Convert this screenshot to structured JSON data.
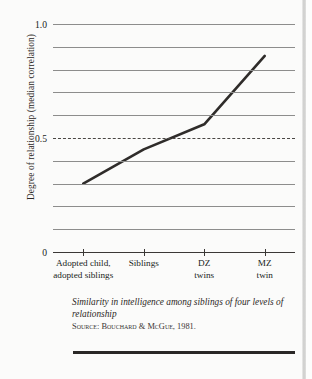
{
  "chart_data": {
    "type": "line",
    "title": "",
    "categories": [
      "Adopted child, adopted siblings",
      "Siblings",
      "DZ twins",
      "MZ twin"
    ],
    "category_lines": [
      [
        "Adopted child,",
        "adopted siblings"
      ],
      [
        "Siblings"
      ],
      [
        "DZ",
        "twins"
      ],
      [
        "MZ",
        "twin"
      ]
    ],
    "values": [
      0.3,
      0.45,
      0.56,
      0.86
    ],
    "xlabel": "",
    "ylabel": "Degree of relationship (median correlation)",
    "ylim": [
      0,
      1.0
    ],
    "ytick_values": [
      0,
      0.5,
      1.0
    ],
    "ytick_labels": [
      "0",
      "0.5",
      "1.0"
    ],
    "gridlines": [
      0.1,
      0.2,
      0.3,
      0.4,
      0.5,
      0.6,
      0.7,
      0.8,
      0.9,
      1.0
    ],
    "dashed_gridline": 0.5,
    "grid": true,
    "legend": "none",
    "line_color": "#2f2c2a",
    "grid_color": "#8d8d8c",
    "axis_color": "#3b3836"
  },
  "caption": {
    "title": "Similarity in intelligence among siblings of four levels of relationship",
    "source_label": "Source:",
    "source_text": "Bouchard & McGue, 1981."
  }
}
